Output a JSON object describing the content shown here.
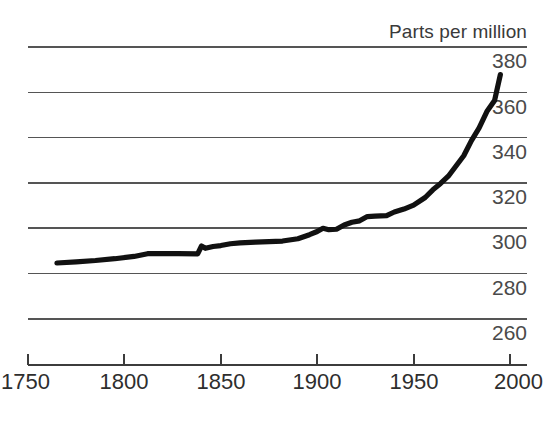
{
  "chart_data": {
    "type": "line",
    "title": "Parts per million",
    "xlabel": "",
    "ylabel": "Parts per million",
    "xlim": [
      1750,
      2000
    ],
    "ylim": [
      250,
      390
    ],
    "grid": true,
    "legend": "none",
    "y_ticks": [
      380,
      360,
      340,
      320,
      300,
      280,
      260
    ],
    "x_ticks": [
      1750,
      1800,
      1850,
      1900,
      1950,
      2000
    ],
    "series": [
      {
        "name": "Atmospheric carbon dioxide concentration",
        "color": "#111111",
        "x": [
          1765,
          1775,
          1785,
          1795,
          1805,
          1812,
          1820,
          1828,
          1838,
          1840,
          1842,
          1846,
          1850,
          1855,
          1860,
          1868,
          1875,
          1882,
          1890,
          1896,
          1900,
          1903,
          1906,
          1910,
          1914,
          1918,
          1922,
          1926,
          1930,
          1936,
          1940,
          1945,
          1950,
          1956,
          1960,
          1964,
          1968,
          1972,
          1976,
          1980,
          1984,
          1988,
          1992,
          1995
        ],
        "y": [
          284.7,
          285.2,
          285.8,
          286.6,
          287.6,
          288.8,
          288.9,
          288.8,
          288.7,
          292.2,
          291.2,
          292.0,
          292.4,
          293.2,
          293.6,
          293.9,
          294.1,
          294.4,
          295.4,
          297.2,
          298.6,
          300.0,
          299.4,
          299.6,
          301.5,
          302.7,
          303.3,
          305.2,
          305.4,
          305.6,
          307.2,
          308.5,
          310.2,
          313.6,
          317.0,
          319.8,
          323.0,
          327.5,
          332.0,
          338.7,
          344.3,
          351.5,
          356.4,
          367.8
        ]
      }
    ],
    "annotations": []
  },
  "layout": {
    "plot_left_px": 28,
    "plot_right_px": 527,
    "axis_line_y_px": 365,
    "tick_x_positions_px": [
      28,
      124,
      221,
      317,
      414,
      510
    ],
    "gridline_y_positions_px": [
      47,
      92.5,
      137.5,
      183,
      228,
      273.5,
      319
    ],
    "background_color": "#ffffff",
    "grid_color": "#555555",
    "line_color": "#111111"
  }
}
